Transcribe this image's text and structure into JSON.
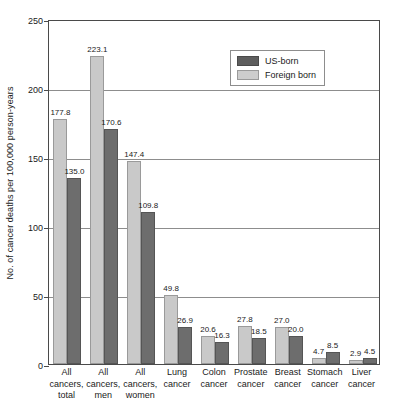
{
  "chart_data": {
    "type": "bar",
    "title": "",
    "subtitle": "",
    "xlabel": "",
    "ylabel": "No. of cancer deaths per 100,000 person-years",
    "ylim": [
      0,
      250
    ],
    "yticks": [
      0,
      50,
      100,
      150,
      200,
      250
    ],
    "grid": true,
    "legend_position": "top-right",
    "orientation": "vertical",
    "grouped": true,
    "categories": [
      "All cancers, total",
      "All cancers, men",
      "All cancers, women",
      "Lung cancer",
      "Colon cancer",
      "Prostate cancer",
      "Breast cancer",
      "Stomach cancer",
      "Liver cancer"
    ],
    "category_lines": [
      [
        "All",
        "cancers,",
        "total"
      ],
      [
        "All",
        "cancers,",
        "men"
      ],
      [
        "All",
        "cancers,",
        "women"
      ],
      [
        "Lung",
        "cancer"
      ],
      [
        "Colon",
        "cancer"
      ],
      [
        "Prostate",
        "cancer"
      ],
      [
        "Breast",
        "cancer"
      ],
      [
        "Stomach",
        "cancer"
      ],
      [
        "Liver",
        "cancer"
      ]
    ],
    "series": [
      {
        "name": "Foreign born",
        "color": "#c9c9c9",
        "values": [
          177.8,
          223.1,
          147.4,
          49.8,
          20.6,
          27.8,
          27.0,
          4.7,
          2.9
        ]
      },
      {
        "name": "US-born",
        "color": "#6d6d6d",
        "values": [
          135.0,
          170.6,
          109.8,
          26.9,
          16.3,
          18.5,
          20.0,
          8.5,
          4.5
        ]
      }
    ],
    "value_labels": {
      "foreign": [
        "177.8",
        "223.1",
        "147.4",
        "49.8",
        "20.6",
        "27.8",
        "27.0",
        "4.7",
        "2.9"
      ],
      "us": [
        "135.0",
        "170.6",
        "109.8",
        "26.9",
        "16.3",
        "18.5",
        "20.0",
        "8.5",
        "4.5"
      ]
    },
    "ytick_labels": [
      "0",
      "50",
      "100",
      "150",
      "200",
      "250"
    ]
  },
  "legend": {
    "items": [
      {
        "label": "US-born",
        "swatch": "us"
      },
      {
        "label": "Foreign born",
        "swatch": "foreign"
      }
    ]
  }
}
